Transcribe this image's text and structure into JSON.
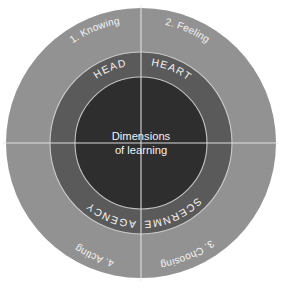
{
  "diagram": {
    "type": "concentric-ring-wheel",
    "center": {
      "line1": "Dimensions",
      "line2": "of learning",
      "color": "#2e2e2e",
      "text_color": "#f2f2f2"
    },
    "geometry": {
      "cx": 141,
      "cy": 143,
      "outer_radius": 135,
      "middle_radius": 91,
      "core_radius": 66,
      "divider_angles_deg": [
        0,
        90,
        180,
        270
      ]
    },
    "colors": {
      "outer_ring": "#929292",
      "middle_ring": "#5a5a5a",
      "core": "#2e2e2e",
      "divider": "#e8e8e8",
      "label": "#f2f2f2",
      "background": "#ffffff"
    },
    "quadrants": [
      {
        "id": "knowing-head",
        "position": "top-left",
        "outer_label": "1. Knowing",
        "middle_label": "HEAD"
      },
      {
        "id": "feeling-heart",
        "position": "top-right",
        "outer_label": "2. Feeling",
        "middle_label": "HEART"
      },
      {
        "id": "choosing-discernment",
        "position": "bottom-right",
        "outer_label": "3. Choosing",
        "middle_label": "DISCERNMENT"
      },
      {
        "id": "acting-agency",
        "position": "bottom-left",
        "outer_label": "4. Acting",
        "middle_label": "AGENCY"
      }
    ]
  }
}
